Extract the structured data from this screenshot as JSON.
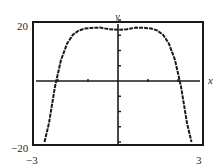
{
  "chart_data": {
    "type": "line",
    "title": "",
    "xlabel": "x",
    "ylabel": "y",
    "xlim": [
      -3,
      3
    ],
    "ylim": [
      -20,
      20
    ],
    "x_tick_labels": [
      "-3",
      "3"
    ],
    "y_tick_labels": [
      "20",
      "-20"
    ],
    "x_ticks": [
      -2,
      -1,
      1,
      2
    ],
    "y_ticks": [
      -20,
      -15,
      -10,
      -5,
      5,
      10,
      15,
      20
    ],
    "grid": false,
    "legend": null,
    "series": [
      {
        "name": "curve",
        "description": "even function with flat top near y≈17.5 and steep fall-off, roots near x≈±2.07",
        "x": [
          -2.45,
          -2.3,
          -2.1,
          -1.9,
          -1.7,
          -1.5,
          -1.3,
          -1.1,
          -0.9,
          -0.6,
          -0.3,
          0,
          0.3,
          0.6,
          0.9,
          1.1,
          1.3,
          1.5,
          1.7,
          1.9,
          2.1,
          2.3,
          2.45
        ],
        "y": [
          -20,
          -13.8,
          -1.8,
          6.9,
          12.2,
          15.2,
          16.6,
          17.2,
          17.4,
          17.5,
          17.0,
          16.8,
          17.0,
          17.5,
          17.4,
          17.2,
          16.6,
          15.2,
          12.2,
          6.9,
          -1.8,
          -13.8,
          -20
        ]
      }
    ]
  },
  "labels": {
    "y_axis": "y",
    "x_axis": "x",
    "y_max": "20",
    "y_min": "−20",
    "x_min": "−3",
    "x_max": "3"
  },
  "colors": {
    "line": "#1a1a1a",
    "frame": "#1a1a1a",
    "background": "#ffffff"
  }
}
